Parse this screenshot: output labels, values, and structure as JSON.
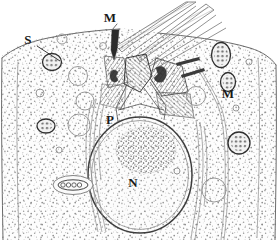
{
  "figure": {
    "kind": "hand-drawn-electron-micrograph-tracing",
    "width_px": 278,
    "height_px": 240,
    "background_color": "#ffffff",
    "ink_color": "#3a3a3a",
    "stipple_color": "#8a8a8a"
  },
  "labels": [
    {
      "id": "label-s",
      "text": "S",
      "x": 28,
      "y": 44,
      "points_to": "small stippled granule / secretory vesicle",
      "has_leader_line": true,
      "leader_from": [
        38,
        46
      ],
      "leader_to": [
        62,
        62
      ]
    },
    {
      "id": "label-m-top",
      "text": "M",
      "x": 110,
      "y": 22,
      "points_to": "membrane / arrowhead at cell apex",
      "has_leader_line": false,
      "has_arrowhead": true
    },
    {
      "id": "label-p",
      "text": "P",
      "x": 110,
      "y": 124,
      "points_to": "dense perinuclear granular body",
      "has_leader_line": false
    },
    {
      "id": "label-n",
      "text": "N",
      "x": 133,
      "y": 187,
      "points_to": "nucleus",
      "has_leader_line": false
    },
    {
      "id": "label-m-right",
      "text": "M",
      "x": 228,
      "y": 98,
      "points_to": "mitochondrion",
      "has_leader_line": false
    }
  ],
  "legend_keys": [
    {
      "symbol": "S",
      "meaning": "secretory granule"
    },
    {
      "symbol": "M",
      "meaning": "mitochondrion / membrane"
    },
    {
      "symbol": "P",
      "meaning": "perinuclear dense body"
    },
    {
      "symbol": "N",
      "meaning": "nucleus"
    }
  ],
  "structures": {
    "nucleus": {
      "name": "nucleus",
      "shape": "large oval",
      "center": [
        140,
        175
      ],
      "rx": 52,
      "ry": 58,
      "envelope_stroke": "#3d3d3d"
    },
    "dense_body": {
      "name": "perinuclear-dense-body",
      "center": [
        146,
        150
      ],
      "rx": 30,
      "ry": 24
    },
    "flagella": {
      "name": "flagellar-axonemes",
      "count": 2,
      "direction": "up-and-right from apex",
      "origin": [
        140,
        62
      ]
    },
    "basal_apparatus": {
      "name": "basal-body-rootlet-complex",
      "region": [
        100,
        50,
        90,
        60
      ],
      "striated": true
    },
    "mitochondria": [
      {
        "id": "mito-right-upper",
        "cx": 221,
        "cy": 55,
        "rx": 9,
        "ry": 12
      },
      {
        "id": "mito-right-lower",
        "cx": 228,
        "cy": 82,
        "rx": 7,
        "ry": 9
      },
      {
        "id": "mito-right-far",
        "cx": 239,
        "cy": 143,
        "rx": 11,
        "ry": 11
      },
      {
        "id": "mito-left-top",
        "cx": 52,
        "cy": 62,
        "rx": 9,
        "ry": 8
      },
      {
        "id": "mito-left-mid",
        "cx": 46,
        "cy": 126,
        "rx": 9,
        "ry": 7
      },
      {
        "id": "mito-left-cristae",
        "cx": 73,
        "cy": 185,
        "rx": 19,
        "ry": 9
      }
    ],
    "vesicles": [
      {
        "id": "vesicle-1",
        "cx": 78,
        "cy": 76,
        "r": 9
      },
      {
        "id": "vesicle-2",
        "cx": 84,
        "cy": 100,
        "r": 9
      },
      {
        "id": "vesicle-3",
        "cx": 79,
        "cy": 124,
        "r": 11
      },
      {
        "id": "vesicle-4",
        "cx": 214,
        "cy": 190,
        "r": 12
      },
      {
        "id": "vesicle-5",
        "cx": 62,
        "cy": 39,
        "r": 5
      },
      {
        "id": "vesicle-6",
        "cx": 196,
        "cy": 95,
        "r": 9
      }
    ],
    "dark_rods": [
      {
        "id": "rod-1",
        "x1": 176,
        "y1": 62,
        "x2": 198,
        "y2": 57
      },
      {
        "id": "rod-2",
        "x1": 180,
        "y1": 74,
        "x2": 202,
        "y2": 68
      }
    ],
    "cell_membrane": {
      "name": "plasma-membrane",
      "stroke": "#6b6b6b",
      "description": "irregular outline spanning full width, open at bottom"
    }
  }
}
